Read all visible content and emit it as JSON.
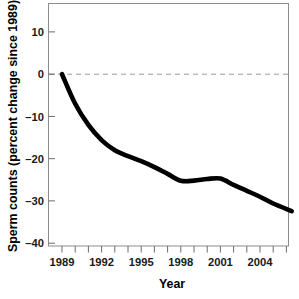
{
  "chart_data": {
    "type": "line",
    "title": "",
    "xlabel": "Year",
    "ylabel": "Sperm counts (percent change since 1989)",
    "xlim": [
      1989,
      2006.5
    ],
    "ylim": [
      -40.7,
      16.0
    ],
    "grid": false,
    "legend": null,
    "zero_reference_line": 0,
    "x_tick_labels": [
      "1989",
      "1992",
      "1995",
      "1998",
      "2001",
      "2004"
    ],
    "x_major_ticks": [
      1989,
      1992,
      1995,
      1998,
      2001,
      2004
    ],
    "x_minor_ticks": [
      1990,
      1991,
      1993,
      1994,
      1996,
      1997,
      1999,
      2000,
      2002,
      2003,
      2005,
      2006
    ],
    "y_tick_labels": [
      "10",
      "0",
      "–10",
      "–20",
      "–30",
      "–40"
    ],
    "y_ticks": [
      10,
      0,
      -10,
      -20,
      -30,
      -40
    ],
    "series": [
      {
        "name": "Sperm count percent change since 1989",
        "x": [
          1989,
          1990,
          1991,
          1992,
          1993,
          1994,
          1995,
          1996,
          1997,
          1998,
          1999,
          2000,
          2001,
          2002,
          2003,
          2004,
          2005,
          2006.4
        ],
        "values": [
          0.0,
          -7.0,
          -12.0,
          -15.6,
          -18.0,
          -19.4,
          -20.6,
          -22.0,
          -23.6,
          -25.2,
          -25.2,
          -24.8,
          -24.7,
          -26.2,
          -27.6,
          -29.0,
          -30.6,
          -32.4
        ]
      }
    ],
    "colors": {
      "curve": "#000000",
      "axis": "#8d8d8d",
      "zero_line": "#9a9a9a",
      "text": "#1a1a1a",
      "background": "#ffffff"
    }
  },
  "axes": {
    "x_title": "Year",
    "y_title": "Sperm counts (percent change since 1989)"
  }
}
